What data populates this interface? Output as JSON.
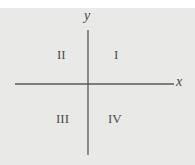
{
  "axes": {
    "x_label": "x",
    "y_label": "y"
  },
  "quadrants": [
    {
      "id": "I",
      "label": "I"
    },
    {
      "id": "II",
      "label": "II"
    },
    {
      "id": "III",
      "label": "III"
    },
    {
      "id": "IV",
      "label": "IV"
    }
  ],
  "colors": {
    "background": "#e9e9e7",
    "axis": "#555555",
    "text": "#4a4a4a"
  }
}
